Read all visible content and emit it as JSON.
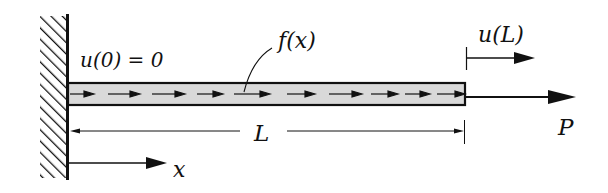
{
  "diagram": {
    "type": "axially loaded bar (fixed-free)",
    "labels": {
      "left_bc": "u(0) = 0",
      "distributed_load": "f(x)",
      "right_displacement": "u(L)",
      "length": "L",
      "end_load": "P",
      "axis": "x"
    },
    "colors": {
      "ink": "#111111",
      "bar_fill": "#d9d9d9",
      "background": "#ffffff"
    },
    "load_arrow_tips_x": [
      90,
      135,
      180,
      218,
      265,
      310,
      358,
      394,
      425,
      460
    ]
  }
}
